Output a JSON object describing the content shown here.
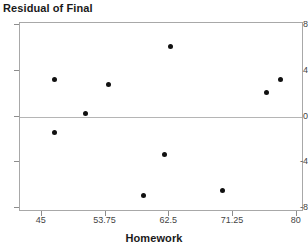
{
  "chart_data": {
    "type": "scatter",
    "title": "",
    "xlabel": "Homework",
    "ylabel": "Residual of Final",
    "xlim": [
      42.0,
      80.98
    ],
    "ylim": [
      -8.34,
      8.17
    ],
    "xticks": [
      45,
      53.75,
      62.5,
      71.25,
      80
    ],
    "xtick_labels": [
      "45",
      "53.75",
      "62.5",
      "71.25",
      "80"
    ],
    "yticks": [
      8,
      4,
      0,
      -4,
      -8
    ],
    "ytick_labels": [
      "8",
      "4",
      "0",
      "-4",
      "-8"
    ],
    "grid": false,
    "legend": null,
    "reference_line": {
      "y": 0,
      "color": "#b5b5b5"
    },
    "marker": {
      "shape": "circle",
      "color": "#111111",
      "size": 5
    },
    "points": [
      {
        "x": 46.8,
        "y": 3.2
      },
      {
        "x": 46.8,
        "y": -1.4
      },
      {
        "x": 51.0,
        "y": 0.3
      },
      {
        "x": 54.1,
        "y": 2.8
      },
      {
        "x": 58.9,
        "y": -6.9
      },
      {
        "x": 61.9,
        "y": -3.3
      },
      {
        "x": 62.7,
        "y": 6.1
      },
      {
        "x": 69.8,
        "y": -6.5
      },
      {
        "x": 75.9,
        "y": 2.1
      },
      {
        "x": 77.7,
        "y": 3.2
      }
    ]
  },
  "axes": {
    "y_title": "Residual of Final",
    "x_title": "Homework"
  },
  "colors": {
    "marker": "#111111",
    "axis": "#a8a8a8",
    "reference_line": "#b5b5b5",
    "tick_text": "#444444",
    "title_text": "#1a1a1a",
    "background": "#ffffff"
  }
}
